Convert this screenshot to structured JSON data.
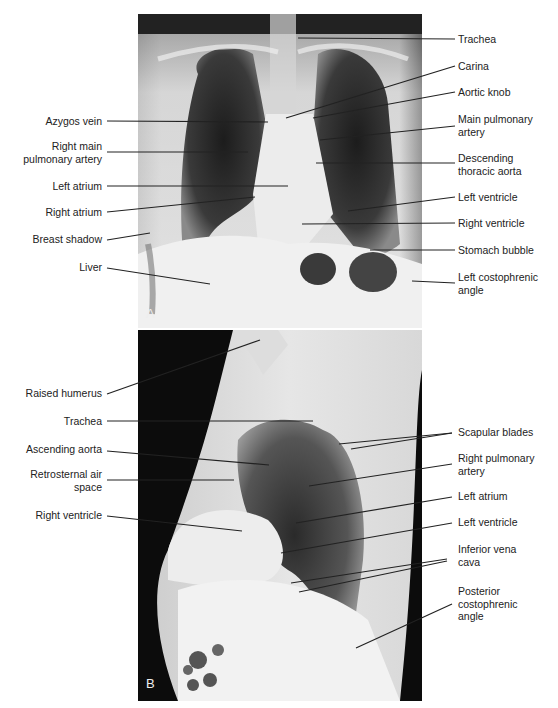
{
  "figure": {
    "panels": [
      {
        "id": "A",
        "label": "A",
        "view": "frontal chest radiograph"
      },
      {
        "id": "B",
        "label": "B",
        "view": "lateral chest radiograph"
      }
    ]
  },
  "panel_a": {
    "left_labels": [
      {
        "text": "Azygos vein"
      },
      {
        "text": "Right main\npulmonary artery"
      },
      {
        "text": "Left atrium"
      },
      {
        "text": "Right atrium"
      },
      {
        "text": "Breast shadow"
      },
      {
        "text": "Liver"
      }
    ],
    "right_labels": [
      {
        "text": "Trachea"
      },
      {
        "text": "Carina"
      },
      {
        "text": "Aortic knob"
      },
      {
        "text": "Main pulmonary\nartery"
      },
      {
        "text": "Descending\nthoracic aorta"
      },
      {
        "text": "Left ventricle"
      },
      {
        "text": "Right ventricle"
      },
      {
        "text": "Stomach bubble"
      },
      {
        "text": "Left costophrenic\nangle"
      }
    ]
  },
  "panel_b": {
    "left_labels": [
      {
        "text": "Raised humerus"
      },
      {
        "text": "Trachea"
      },
      {
        "text": "Ascending aorta"
      },
      {
        "text": "Retrosternal air\nspace"
      },
      {
        "text": "Right ventricle"
      }
    ],
    "right_labels": [
      {
        "text": "Scapular blades"
      },
      {
        "text": "Right pulmonary\nartery"
      },
      {
        "text": "Left atrium"
      },
      {
        "text": "Left ventricle"
      },
      {
        "text": "Inferior vena\ncava"
      },
      {
        "text": "Posterior\ncostophrenic\nangle"
      }
    ]
  },
  "colors": {
    "leader_line": "#222222",
    "label_text": "#222222",
    "panel_label": "#eeeeee"
  }
}
